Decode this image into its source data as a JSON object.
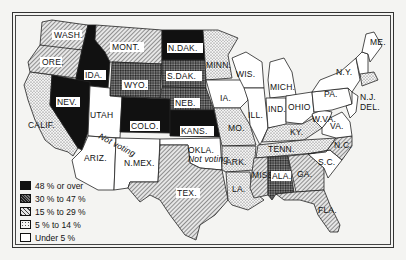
{
  "map": {
    "type": "choropleth",
    "region": "United States (48 states)",
    "legend": [
      {
        "label": "48 % or over",
        "pattern": "solid-black",
        "color": "#111111"
      },
      {
        "label": "30 % to 47 %",
        "pattern": "dark-crosshatch",
        "color": "#444444"
      },
      {
        "label": "15 % to 29 %",
        "pattern": "diagonal-hatch",
        "color": "#888888"
      },
      {
        "label": "5 % to 14 %",
        "pattern": "dotted",
        "color": "#c8c8c8"
      },
      {
        "label": "Under 5 %",
        "pattern": "white",
        "color": "#ffffff"
      }
    ],
    "annotations": {
      "okla_not_voting": "Not voting",
      "ariz_not_voting": "Not voting"
    },
    "states": {
      "wash": "WASH.",
      "ore": "ORE.",
      "calif": "CALIF.",
      "ida": "IDA.",
      "nev": "NEV.",
      "mont": "MONT.",
      "wyo": "WYO.",
      "utah": "UTAH",
      "colo": "COLO.",
      "ariz": "ARIZ.",
      "nmex": "N.MEX.",
      "ndak": "N.DAK.",
      "sdak": "S.DAK.",
      "neb": "NEB.",
      "kans": "KANS.",
      "okla": "OKLA.",
      "tex": "TEX.",
      "minn": "MINN.",
      "ia": "IA.",
      "mo": "MO.",
      "ark": "ARK.",
      "la": "LA.",
      "wis": "WIS.",
      "ill": "ILL.",
      "mich": "MICH.",
      "ind": "IND.",
      "ohio": "OHIO",
      "ky": "KY.",
      "tenn": "TENN.",
      "miss": "MISS.",
      "ala": "ALA.",
      "ga": "GA.",
      "fla": "FLA.",
      "sc": "S.C.",
      "nc": "N.C.",
      "va": "VA.",
      "wva": "W.VA.",
      "pa": "PA.",
      "ny": "N.Y.",
      "nj": "N.J.",
      "del": "DEL.",
      "me": "ME.",
      "vt": "VT.",
      "nh": "N.H.",
      "mass": "MASS."
    },
    "categories": {
      "48_or_over": [
        "IDA.",
        "NEV.",
        "COLO.",
        "KANS.",
        "N.DAK."
      ],
      "30_to_47": [
        "WYO.",
        "S.DAK.",
        "NEB.",
        "ALA."
      ],
      "15_to_29": [
        "WASH.",
        "ORE.",
        "MONT.",
        "TEX.",
        "MISS.",
        "GA.",
        "N.C.",
        "FLA."
      ],
      "5_to_14": [
        "CALIF.",
        "MINN.",
        "MO.",
        "ARK.",
        "LA.",
        "KY.",
        "TENN.",
        "MASS."
      ],
      "under_5": [
        "UTAH",
        "ARIZ.",
        "N.MEX.",
        "IA.",
        "WIS.",
        "ILL.",
        "MICH.",
        "IND.",
        "OHIO",
        "PA.",
        "N.Y.",
        "N.J.",
        "DEL.",
        "W.VA.",
        "VA.",
        "S.C.",
        "ME.",
        "VT.",
        "N.H."
      ],
      "not_voting": [
        "OKLA."
      ]
    }
  }
}
